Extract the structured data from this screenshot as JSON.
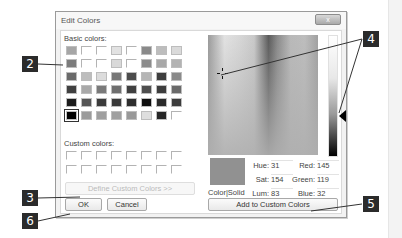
{
  "dialog": {
    "title": "Edit Colors",
    "close_label": "x"
  },
  "basic_colors": {
    "label": "Basic colors:",
    "rows": [
      [
        "#a6a6a6",
        "empty",
        "empty",
        "#e2e2e2",
        "empty",
        "#8a8a8a",
        "#bdbdbd",
        "#dadada"
      ],
      [
        "#7c7c7c",
        "empty",
        "empty",
        "#d9d9d9",
        "empty",
        "#8c8c8c",
        "#a8a8a8",
        "#b3b3b3"
      ],
      [
        "#6a6a6a",
        "#bdbdbd",
        "#dcdcdc",
        "#777777",
        "#4c4c4c",
        "#b6b6b6",
        "#3e3e3e",
        "#8a8a8a"
      ],
      [
        "#404040",
        "#a9a9a9",
        "#7a7a7a",
        "#6f6f6f",
        "#404040",
        "#4e4e4e",
        "#3d3d3d",
        "#6a6a6a"
      ],
      [
        "#1c1c1c",
        "#555555",
        "#3b3b3b",
        "#3a3a3a",
        "#2e2e2e",
        "#0e0e0e",
        "#2a2a2a",
        "#3c3c3c"
      ],
      [
        "#000000",
        "#9b9b9b",
        "#9f9f9f",
        "#a0a0a0",
        "#999999",
        "#dedede",
        "#262626",
        "empty"
      ]
    ],
    "selected": [
      5,
      0
    ]
  },
  "custom_colors": {
    "label": "Custom colors:",
    "rows": 2,
    "cols": 8
  },
  "buttons": {
    "define_custom": "Define Custom Colors >>",
    "ok": "OK",
    "cancel": "Cancel",
    "add_custom": "Add to Custom Colors"
  },
  "preview": {
    "label": "Color|Solid",
    "color": "#919191"
  },
  "fields": {
    "hue": {
      "label": "Hue:",
      "value": "31"
    },
    "sat": {
      "label": "Sat:",
      "value": "154"
    },
    "lum": {
      "label": "Lum:",
      "value": "83"
    },
    "red": {
      "label": "Red:",
      "value": "145"
    },
    "green": {
      "label": "Green:",
      "value": "119"
    },
    "blue": {
      "label": "Blue:",
      "value": "32"
    }
  },
  "callouts": {
    "c2": "2",
    "c3": "3",
    "c4": "4",
    "c5": "5",
    "c6": "6"
  }
}
